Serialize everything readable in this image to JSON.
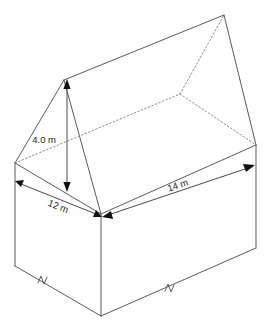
{
  "diagram": {
    "shape": "rectangular prism with hipped (pitched) roof",
    "line_color": "#5a5a5a",
    "hidden_line_color": "#8d8d8d",
    "background_color": "#ffffff",
    "text_color": "#1b1b1b"
  },
  "labels": {
    "height": "4.0 m",
    "width": "12 m",
    "length": "14 m"
  },
  "measurements": [
    {
      "name": "roof-height",
      "value": "4.0",
      "unit": "m",
      "text": "4.0 m"
    },
    {
      "name": "base-width",
      "value": "12",
      "unit": "m",
      "text": "12 m"
    },
    {
      "name": "base-length",
      "value": "14",
      "unit": "m",
      "text": "14 m"
    }
  ],
  "annotations": {
    "break_marks": 2,
    "dimension_arrows": 3
  }
}
